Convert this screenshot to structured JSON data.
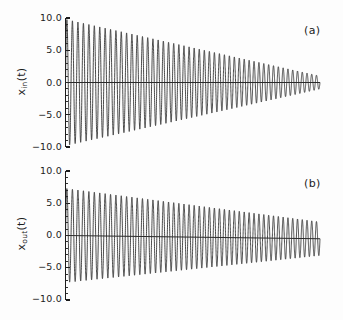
{
  "figure": {
    "background_color": "#fdfdfd",
    "line_color": "#2a2a2a",
    "axis_color": "#1c1c1c"
  },
  "panels": [
    {
      "tag": "(a)",
      "ylabel_main": "x",
      "ylabel_sub": "in",
      "ylabel_tail": "(t)",
      "ytick_labels": [
        "10.0",
        "5.0",
        "0.0",
        "−5.0",
        "−10.0"
      ]
    },
    {
      "tag": "(b)",
      "ylabel_main": "x",
      "ylabel_sub": "out",
      "ylabel_tail": "(t)",
      "ytick_labels": [
        "10.0",
        "5.0",
        "0.0",
        "−5.0",
        "−10.0"
      ]
    }
  ],
  "chart_data": [
    {
      "type": "line",
      "panel": "(a)",
      "title": "",
      "xlabel": "",
      "ylabel": "x_in(t)",
      "ylim": [
        -10.0,
        10.0
      ],
      "yticks": [
        10.0,
        5.0,
        0.0,
        -5.0,
        -10.0
      ],
      "minor_yticks_per_interval": 4,
      "xlim": [
        0,
        100
      ],
      "xaxis_visible": false,
      "grid": false,
      "legend": null,
      "description": "Damped sinusoidal input signal, amplitude decaying roughly linearly from 9.8 to about 1.0 over the record, with about 50 oscillation cycles and slowly increasing frequency.",
      "series": [
        {
          "name": "x_in(t)",
          "color": "#2a2a2a",
          "envelope_start": 9.8,
          "envelope_end": 1.0,
          "envelope_shape": "near-linear decay",
          "cycles": 50,
          "baseline": 0.0,
          "baseline_tilt": 0.0,
          "chirp": 1.18
        }
      ]
    },
    {
      "type": "line",
      "panel": "(b)",
      "title": "",
      "xlabel": "",
      "ylabel": "x_out(t)",
      "ylim": [
        -10.0,
        10.0
      ],
      "yticks": [
        10.0,
        5.0,
        0.0,
        -5.0,
        -10.0
      ],
      "minor_yticks_per_interval": 4,
      "xlim": [
        0,
        100
      ],
      "xaxis_visible": false,
      "grid": false,
      "legend": null,
      "description": "Damped sinusoidal output signal, amplitude decaying from about 7.3 to about 2.6 with a slight downward baseline drift; about 50 oscillation cycles with slowly increasing frequency.",
      "series": [
        {
          "name": "x_out(t)",
          "color": "#2a2a2a",
          "envelope_start": 7.3,
          "envelope_end": 2.6,
          "envelope_shape": "near-linear decay",
          "cycles": 50,
          "baseline": 0.0,
          "baseline_tilt": -0.5,
          "chirp": 1.18
        }
      ]
    }
  ]
}
